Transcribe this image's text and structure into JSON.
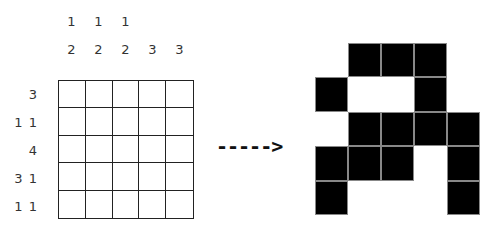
{
  "puzzle": {
    "column_clues": [
      [
        "1",
        "2"
      ],
      [
        "1",
        "2"
      ],
      [
        "1",
        "2"
      ],
      [
        "3"
      ],
      [
        "3"
      ]
    ],
    "row_clues": [
      "3",
      "1 1",
      "4",
      "3 1",
      "1 1"
    ],
    "rows": 5,
    "cols": 5
  },
  "arrow": {
    "label": "----->"
  },
  "solution": {
    "grid": [
      [
        0,
        1,
        1,
        1,
        0
      ],
      [
        1,
        0,
        0,
        1,
        0
      ],
      [
        0,
        1,
        1,
        1,
        1
      ],
      [
        1,
        1,
        1,
        0,
        1
      ],
      [
        1,
        0,
        0,
        0,
        1
      ]
    ],
    "filled_color": "#000000",
    "empty_color": "#ffffff"
  }
}
